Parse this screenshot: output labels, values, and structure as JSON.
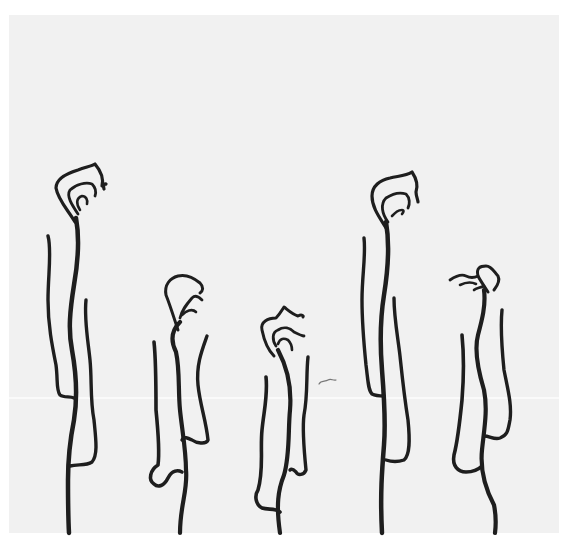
{
  "artwork": {
    "description": "Line drawing of five vertical vine-like / cloud-topped figures on a light gray paper background",
    "background_color": "#f1f1f1",
    "border_color": "#ffffff",
    "ink_color": "#1e1e1e",
    "figure_count": 5,
    "figures": [
      {
        "id": "figure-1",
        "label": "tall left figure"
      },
      {
        "id": "figure-2",
        "label": "short figure"
      },
      {
        "id": "figure-3",
        "label": "shortest middle figure"
      },
      {
        "id": "figure-4",
        "label": "tall right figure"
      },
      {
        "id": "figure-5",
        "label": "short right figure"
      }
    ],
    "stray_mark": "small squiggle near center"
  }
}
